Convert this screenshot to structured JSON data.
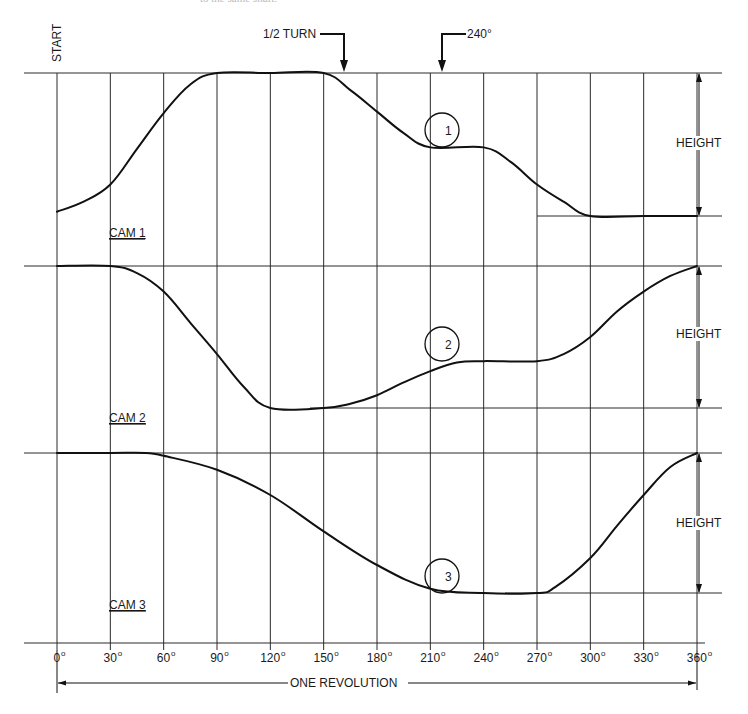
{
  "caption_fragment": "to the same shaft.",
  "labels": {
    "start": "START",
    "half_turn": "1/2 TURN",
    "deg240": "240°",
    "one_revolution": "ONE REVOLUTION",
    "height": "HEIGHT",
    "cam1": "CAM 1",
    "cam2": "CAM 2",
    "cam3": "CAM 3",
    "follower1": "1",
    "follower2": "2",
    "follower3": "3"
  },
  "axis": {
    "ticks": [
      "0°",
      "30°",
      "60°",
      "90°",
      "120°",
      "150°",
      "180°",
      "210°",
      "240°",
      "270°",
      "300°",
      "330°",
      "360°"
    ]
  },
  "chart_data": {
    "type": "line",
    "xlabel": "ONE REVOLUTION (degrees)",
    "ylabel": "HEIGHT (follower rise, fraction of full height)",
    "x_ticks": [
      0,
      30,
      60,
      90,
      120,
      150,
      180,
      210,
      240,
      270,
      300,
      330,
      360
    ],
    "xlim": [
      0,
      360
    ],
    "ylim": [
      0,
      1
    ],
    "annotations": [
      {
        "text": "START",
        "x": 0
      },
      {
        "text": "1/2 TURN",
        "x": 180
      },
      {
        "text": "240°",
        "x": 240
      },
      {
        "text": "Follower 1 on CAM 1",
        "x": 240,
        "y": 0.48
      },
      {
        "text": "Follower 2 on CAM 2",
        "x": 240,
        "y": 0.33
      },
      {
        "text": "Follower 3 on CAM 3",
        "x": 240,
        "y": 0.0
      }
    ],
    "series": [
      {
        "name": "CAM 1",
        "x": [
          0,
          15,
          30,
          45,
          60,
          75,
          90,
          120,
          150,
          165,
          180,
          195,
          210,
          240,
          255,
          270,
          285,
          300,
          330,
          360
        ],
        "values": [
          0.03,
          0.1,
          0.22,
          0.47,
          0.72,
          0.92,
          1.0,
          1.0,
          1.0,
          0.88,
          0.73,
          0.58,
          0.48,
          0.48,
          0.38,
          0.22,
          0.1,
          0.0,
          0.0,
          0.0
        ]
      },
      {
        "name": "CAM 2",
        "x": [
          0,
          30,
          45,
          60,
          75,
          90,
          105,
          120,
          150,
          165,
          180,
          195,
          210,
          225,
          240,
          270,
          285,
          300,
          315,
          330,
          345,
          360
        ],
        "values": [
          1.0,
          1.0,
          0.95,
          0.82,
          0.6,
          0.38,
          0.15,
          0.0,
          0.0,
          0.03,
          0.09,
          0.18,
          0.26,
          0.32,
          0.33,
          0.33,
          0.38,
          0.5,
          0.68,
          0.82,
          0.93,
          1.0
        ]
      },
      {
        "name": "CAM 3",
        "x": [
          0,
          30,
          50,
          60,
          90,
          120,
          150,
          180,
          210,
          240,
          270,
          280,
          300,
          315,
          330,
          345,
          360
        ],
        "values": [
          1.0,
          1.0,
          1.0,
          0.98,
          0.88,
          0.7,
          0.44,
          0.2,
          0.03,
          0.0,
          0.0,
          0.04,
          0.25,
          0.48,
          0.7,
          0.9,
          1.0
        ]
      }
    ]
  }
}
